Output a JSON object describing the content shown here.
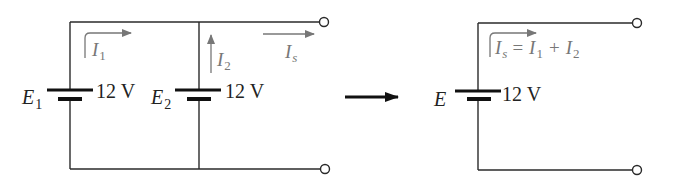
{
  "diagram": {
    "type": "circuit-equivalence",
    "left_circuit": {
      "sources": [
        {
          "name_main": "E",
          "name_sub": "1",
          "voltage": "12 V"
        },
        {
          "name_main": "E",
          "name_sub": "2",
          "voltage": "12 V"
        }
      ],
      "currents": [
        {
          "main": "I",
          "sub": "1"
        },
        {
          "main": "I",
          "sub": "2"
        },
        {
          "main": "I",
          "sub": "s"
        }
      ]
    },
    "transform_arrow": "equivalent-to",
    "right_circuit": {
      "source": {
        "name_main": "E",
        "voltage": "12 V"
      },
      "current_equation": {
        "lhs_main": "I",
        "lhs_sub": "s",
        "eq": "=",
        "t1_main": "I",
        "t1_sub": "1",
        "plus": "+",
        "t2_main": "I",
        "t2_sub": "2"
      }
    },
    "colors": {
      "wire": "#2a2a2a",
      "current_annotation": "#777777",
      "label": "#222222"
    }
  }
}
